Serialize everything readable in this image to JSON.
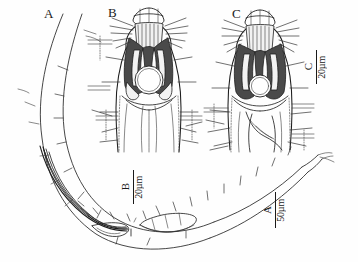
{
  "figure": {
    "kind": "scientific-line-drawing",
    "background_color": "#fefefe",
    "ink_color": "#262626",
    "width": 358,
    "height": 262
  },
  "panels": [
    {
      "id": "A",
      "label": "A",
      "x": 44,
      "y": 7,
      "description": "whole male posterior body with spicules"
    },
    {
      "id": "B",
      "label": "B",
      "x": 108,
      "y": 6,
      "description": "anterior end, cephalic region, left specimen"
    },
    {
      "id": "C",
      "label": "C",
      "x": 232,
      "y": 7,
      "description": "anterior end, cephalic region, right specimen"
    }
  ],
  "scale_bars": [
    {
      "id": "A",
      "label": "A",
      "unit": "50µm",
      "x": 262,
      "y": 192,
      "length": 36
    },
    {
      "id": "B",
      "label": "B",
      "unit": "20µm",
      "x": 120,
      "y": 170,
      "length": 34
    },
    {
      "id": "C",
      "label": "C",
      "unit": "20µm",
      "x": 303,
      "y": 50,
      "length": 34
    }
  ]
}
